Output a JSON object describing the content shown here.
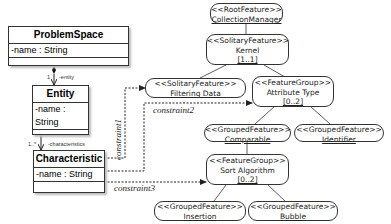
{
  "uml_classes": {
    "problem_space": {
      "name": "ProblemSpace",
      "attribute": "-name : String"
    },
    "entity": {
      "name": "Entity",
      "attribute": "-name : String"
    },
    "characteristic": {
      "name": "Characteristic",
      "attribute": "-name : String"
    }
  },
  "associations": {
    "ps_entity": {
      "multiplicity": "1",
      "role": "-entity"
    },
    "entity_char": {
      "multiplicity": "1..*",
      "role": "-characteristics"
    }
  },
  "constraints": {
    "c1": "constraint1",
    "c2": "constraint2",
    "c3": "constraint3"
  },
  "features": {
    "root": {
      "stereotype": "<<RootFeature>>",
      "name": "CollectionManager"
    },
    "kernel": {
      "stereotype": "<<SolitaryFeature>>",
      "name": "Kernel",
      "cardinality": "[1..1]"
    },
    "filtering": {
      "stereotype": "<<SolitaryFeature>>",
      "name": "Filtering Data"
    },
    "attribute_type": {
      "stereotype": "<<FeatureGroup>>",
      "name": "Attribute Type",
      "cardinality": "[0..2]"
    },
    "comparable": {
      "stereotype": "<<GroupedFeature>>",
      "name": "Comparable"
    },
    "identifier": {
      "stereotype": "<<GroupedFeature>>",
      "name": "Identifier"
    },
    "sort_algorithm": {
      "stereotype": "<<FeatureGroup>>",
      "name": "Sort Algorithm",
      "cardinality": "[0..2]"
    },
    "insertion": {
      "stereotype": "<<GroupedFeature>>",
      "name": "Insertion"
    },
    "bubble": {
      "stereotype": "<<GroupedFeature>>",
      "name": "Bubble"
    }
  }
}
